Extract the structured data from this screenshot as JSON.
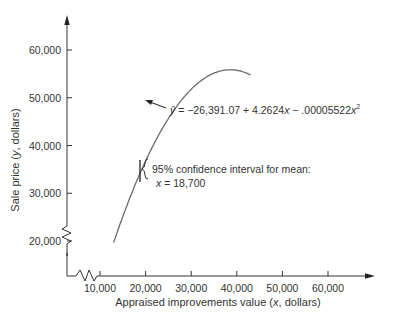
{
  "chart_data": {
    "type": "line",
    "title": "",
    "xlabel": "Appraised improvements value (x, dollars)",
    "ylabel": "Sale price (y, dollars)",
    "x_ticks": [
      "10,000",
      "20,000",
      "30,000",
      "40,000",
      "50,000",
      "60,000"
    ],
    "x_tick_values": [
      10000,
      20000,
      30000,
      40000,
      50000,
      60000
    ],
    "y_ticks": [
      "20,000",
      "30,000",
      "40,000",
      "50,000",
      "60,000"
    ],
    "y_tick_values": [
      20000,
      30000,
      40000,
      50000,
      60000
    ],
    "xlim": [
      3000,
      68000
    ],
    "ylim": [
      13000,
      66000
    ],
    "grid": false,
    "axis_breaks": {
      "x": true,
      "y": true
    },
    "series": [
      {
        "name": "fitted quadratic",
        "equation": "ŷ = −26,391.07 + 4.2624x − .00005522x²",
        "x": [
          13000,
          16000,
          19000,
          22000,
          25000,
          28000,
          31000,
          34000,
          37000,
          38600,
          40000,
          43000
        ],
        "y": [
          19688,
          27663,
          34645,
          40635,
          45633,
          49638,
          52651,
          54671,
          55699,
          55860,
          55806,
          54791
        ]
      }
    ],
    "annotations": [
      {
        "text_parts": [
          "ŷ = −26,391.07 + 4.2624",
          "x",
          " − .00005522",
          "x",
          "2"
        ],
        "points_to_x": 26000
      },
      {
        "text": "95% confidence interval for mean:",
        "line2": "x = 18,700",
        "x": 18700
      }
    ]
  },
  "labels": {
    "xlabel_pre": "Appraised improvements value (",
    "xlabel_var": "x",
    "xlabel_post": ", dollars)",
    "ylabel_pre": "Sale price (",
    "ylabel_var": "y",
    "ylabel_post": ", dollars)",
    "eq_yhat": "ŷ",
    "eq_a": " = −26,391.07 + 4.2624",
    "eq_x1": "x",
    "eq_b": " − .00005522",
    "eq_x2": "x",
    "eq_sup": "2",
    "ci_line1": "95% confidence interval for mean:",
    "ci_line2": "x = 18,700"
  },
  "colors": {
    "curve": "#6a6a6a",
    "axis": "#333333",
    "text": "#333333"
  }
}
